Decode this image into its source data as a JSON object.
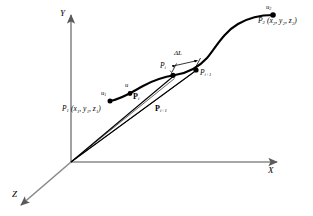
{
  "figure": {
    "background_color": "#ffffff",
    "curve_color": "#000000",
    "axis_color": "#7a7a7a",
    "vector_color": "#000000"
  },
  "axes": {
    "x_label": "X",
    "y_label": "Y",
    "z_label": "Z"
  },
  "labels": {
    "u1": "u",
    "u1_sub": "1",
    "u2": "u",
    "u2_sub": "2",
    "u": "u",
    "p1_point": "P",
    "p1_sub": "1",
    "p1_coords": "(x",
    "p1_coords_full": "P1 (x1, y1, z1)",
    "p2_coords_full": "P2 (x2, y2, z2)",
    "pi": "P",
    "pi_sub": "i",
    "pi1": "P",
    "pi1_sub": "i+1",
    "vec_pi": "P",
    "vec_pi_sub": "i",
    "vec_pi1": "P",
    "vec_pi1_sub": "i+1",
    "delta_l": "ΔL"
  },
  "points": [
    {
      "name": "P1",
      "label": "P",
      "subscript": "1",
      "coords": "(x₁, y₁, z₁)",
      "param": "u₁"
    },
    {
      "name": "Pi",
      "label": "P",
      "subscript": "i",
      "coords": "",
      "param": ""
    },
    {
      "name": "Pi+1",
      "label": "P",
      "subscript": "i+1",
      "coords": "",
      "param": ""
    },
    {
      "name": "P2",
      "label": "P",
      "subscript": "2",
      "coords": "(x₂, y₂, z₂)",
      "param": "u₂"
    }
  ],
  "annotations": {
    "arc_increment": "ΔL",
    "parameter_symbol": "u"
  },
  "coord_text": {
    "p1": "(x1, y1, z1)",
    "p2": "(x2, y2, z2)"
  }
}
